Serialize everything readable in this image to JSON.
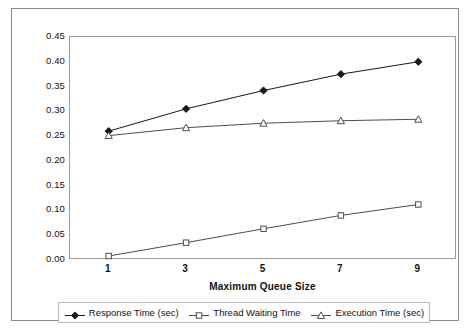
{
  "chart_data": {
    "type": "line",
    "title": "",
    "xlabel": "Maximum Queue Size",
    "ylabel": "",
    "x": [
      1,
      3,
      5,
      7,
      9
    ],
    "categories": [
      "1",
      "3",
      "5",
      "7",
      "9"
    ],
    "xtick_labels": [
      "1",
      "3",
      "5",
      "7",
      "9"
    ],
    "ytick_labels": [
      "0.45",
      "0.40",
      "0.35",
      "0.30",
      "0.25",
      "0.20",
      "0.15",
      "0.10",
      "0.05",
      "0.00"
    ],
    "ytick_values": [
      0.45,
      0.4,
      0.35,
      0.3,
      0.25,
      0.2,
      0.15,
      0.1,
      0.05,
      0.0
    ],
    "ylim": [
      0.0,
      0.45
    ],
    "xlim": [
      0,
      10
    ],
    "grid": false,
    "legend_position": "bottom",
    "series": [
      {
        "name": "Response Time (sec)",
        "marker": "filled-diamond",
        "color": "#1a1a1a",
        "values": [
          0.26,
          0.305,
          0.342,
          0.375,
          0.4
        ]
      },
      {
        "name": "Thread Waiting Time",
        "marker": "open-square",
        "color": "#4d4d4d",
        "values": [
          0.008,
          0.035,
          0.063,
          0.09,
          0.112
        ]
      },
      {
        "name": "Execution Time (sec)",
        "marker": "open-triangle",
        "color": "#4d4d4d",
        "values": [
          0.251,
          0.267,
          0.276,
          0.281,
          0.284
        ]
      }
    ]
  },
  "legend": {
    "items": [
      {
        "label": "Response Time (sec)"
      },
      {
        "label": "Thread Waiting Time"
      },
      {
        "label": "Execution Time (sec)"
      }
    ]
  },
  "axes": {
    "x_title": "Maximum Queue Size"
  },
  "colors": {
    "frame": "#8b8b8b",
    "plot_border": "#9a9a9a",
    "series_dark": "#1a1a1a",
    "series_gray": "#4d4d4d",
    "background": "#ffffff"
  }
}
